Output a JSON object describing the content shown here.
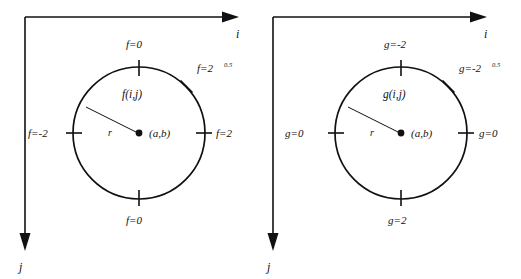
{
  "figure": {
    "panels": [
      {
        "id": "left",
        "function_label": "f(i,j)",
        "center_label": "(a,b)",
        "radius_label": "r",
        "axis_i_label": "i",
        "axis_j_label": "j",
        "ticks": [
          {
            "position": "top",
            "label": "f=0"
          },
          {
            "position": "right",
            "label": "f=2"
          },
          {
            "position": "bottom",
            "label": "f=0"
          },
          {
            "position": "left",
            "label": "f=-2"
          },
          {
            "position": "upper-right-diagonal",
            "label": "f=2",
            "superscript": "0.5"
          }
        ]
      },
      {
        "id": "right",
        "function_label": "g(i,j)",
        "center_label": "(a,b)",
        "radius_label": "r",
        "axis_i_label": "i",
        "axis_j_label": "j",
        "ticks": [
          {
            "position": "top",
            "label": "g=-2"
          },
          {
            "position": "right",
            "label": "g=0"
          },
          {
            "position": "bottom",
            "label": "g=2"
          },
          {
            "position": "left",
            "label": "g=0"
          },
          {
            "position": "upper-right-diagonal",
            "label": "g=-2",
            "superscript": "0.5"
          }
        ]
      }
    ],
    "colors": {
      "stroke": "#111111",
      "background": "#ffffff"
    }
  }
}
